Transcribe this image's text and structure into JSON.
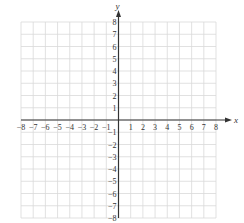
{
  "chart_data": {
    "type": "scatter",
    "title": "",
    "xlabel": "x",
    "ylabel": "y",
    "xlim": [
      -8,
      8
    ],
    "ylim": [
      -8,
      8
    ],
    "grid": true,
    "x_ticks": [
      -8,
      -7,
      -6,
      -5,
      -4,
      -3,
      -2,
      -1,
      1,
      2,
      3,
      4,
      5,
      6,
      7,
      8
    ],
    "y_ticks": [
      -8,
      -7,
      -6,
      -5,
      -4,
      -3,
      -2,
      -1,
      1,
      2,
      3,
      4,
      5,
      6,
      7,
      8
    ],
    "x_tick_labels": [
      "−8",
      "−7",
      "−6",
      "−5",
      "−4",
      "−3",
      "−2",
      "−1",
      "1",
      "2",
      "3",
      "4",
      "5",
      "6",
      "7",
      "8"
    ],
    "y_tick_labels": [
      "−8",
      "−7",
      "−6",
      "−5",
      "−4",
      "−3",
      "−2",
      "−1",
      "1",
      "2",
      "3",
      "4",
      "5",
      "6",
      "7",
      "8"
    ],
    "series": [],
    "legend": null
  },
  "colors": {
    "grid": "#d9d9d9",
    "axis": "#333333",
    "label": "#333333"
  },
  "layout": {
    "x_min_px": 21,
    "x_max_px": 216,
    "y_min_px": 218,
    "y_max_px": 22
  }
}
